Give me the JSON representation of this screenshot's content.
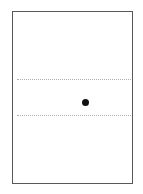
{
  "figure": {
    "type": "schematic-diagram",
    "canvas": {
      "width": 143,
      "height": 194,
      "background_color": "#ffffff"
    },
    "frame": {
      "label": "outer-rectangle-border",
      "x": 12,
      "y": 11,
      "width": 121,
      "height": 173,
      "border_color": "#595959",
      "border_width": 1.5,
      "fill_color": "#ffffff"
    },
    "dotted_lines": [
      {
        "label": "upper-dotted-guide-line",
        "x": 17,
        "y": 79,
        "length": 114,
        "color": "#b0b0b0",
        "thickness": 1.5,
        "style": "dotted"
      },
      {
        "label": "lower-dotted-guide-line",
        "x": 17,
        "y": 115,
        "length": 114,
        "color": "#b0b0b0",
        "thickness": 1.5,
        "style": "dotted"
      }
    ],
    "markers": [
      {
        "label": "black-point-marker",
        "cx": 85,
        "cy": 102,
        "diameter": 7,
        "color": "#111111",
        "shape": "circle"
      }
    ]
  },
  "chart_data": {
    "type": "scatter",
    "title": "",
    "xlabel": "",
    "ylabel": "",
    "grid": false,
    "legend": null,
    "annotations": [],
    "tick_labels": {
      "x": [],
      "y": []
    },
    "guides": [
      {
        "name": "upper dotted horizontal line",
        "orientation": "horizontal",
        "y_px": 79
      },
      {
        "name": "lower dotted horizontal line",
        "orientation": "horizontal",
        "y_px": 115
      }
    ],
    "points": [
      {
        "label": "point-1",
        "x_px": 85,
        "y_px": 102
      }
    ],
    "xlim": [
      12,
      133
    ],
    "ylim": [
      11,
      184
    ]
  }
}
